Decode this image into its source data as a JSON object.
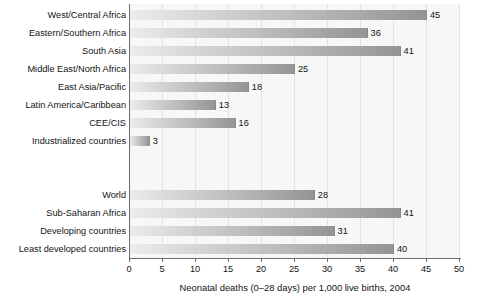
{
  "chart_data": {
    "type": "bar",
    "orientation": "horizontal",
    "title": "",
    "subtitle": "",
    "xlabel": "Neonatal deaths (0–28 days) per 1,000 live births, 2004",
    "ylabel": "",
    "xlim": [
      0,
      50
    ],
    "xticks": [
      0,
      5,
      10,
      15,
      20,
      25,
      30,
      35,
      40,
      45,
      50
    ],
    "xtick_labels": [
      "0",
      "5",
      "10",
      "15",
      "20",
      "25",
      "30",
      "35",
      "40",
      "45",
      "50"
    ],
    "grid": "vertical",
    "legend": "none",
    "bar_color_start": "#ececec",
    "bar_color_end": "#949494",
    "plot_background": "#f7f7f7",
    "axis_color": "#6e6e6e",
    "groups": [
      {
        "name": "regions",
        "categories": [
          "West/Central Africa",
          "Eastern/Southern Africa",
          "South Asia",
          "Middle East/North Africa",
          "East Asia/Pacific",
          "Latin America/Caribbean",
          "CEE/CIS",
          "Industrialized countries"
        ],
        "values": [
          45,
          36,
          41,
          25,
          18,
          13,
          16,
          3
        ]
      },
      {
        "name": "aggregates",
        "categories": [
          "World",
          "Sub-Saharan Africa",
          "Developing countries",
          "Least developed countries"
        ],
        "values": [
          28,
          41,
          31,
          40
        ]
      }
    ],
    "categories": [
      "West/Central Africa",
      "Eastern/Southern Africa",
      "South Asia",
      "Middle East/North Africa",
      "East Asia/Pacific",
      "Latin America/Caribbean",
      "CEE/CIS",
      "Industrialized countries",
      "World",
      "Sub-Saharan Africa",
      "Developing countries",
      "Least developed countries"
    ],
    "values": [
      45,
      36,
      41,
      25,
      18,
      13,
      16,
      3,
      28,
      41,
      31,
      40
    ]
  }
}
